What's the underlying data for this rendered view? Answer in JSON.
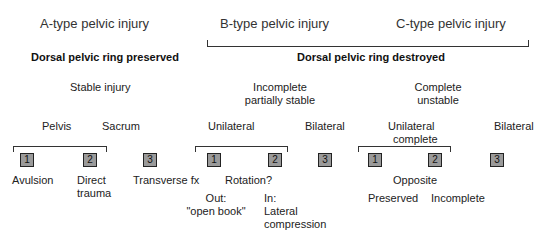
{
  "headers": {
    "a_type": "A-type pelvic injury",
    "b_type": "B-type pelvic injury",
    "c_type": "C-type pelvic injury"
  },
  "dorsal": {
    "preserved": "Dorsal pelvic ring preserved",
    "destroyed": "Dorsal pelvic ring destroyed"
  },
  "stability": {
    "a": "Stable injury",
    "b_line1": "Incomplete",
    "b_line2": "partially stable",
    "c_line1": "Complete",
    "c_line2": "unstable"
  },
  "subgroups": {
    "a_pelvis": "Pelvis",
    "a_sacrum": "Sacrum",
    "b_unilateral": "Unilateral",
    "b_bilateral": "Bilateral",
    "c_unilateral_line1": "Unilateral",
    "c_unilateral_line2": "complete",
    "c_bilateral": "Bilateral"
  },
  "boxes": [
    "1",
    "2",
    "3",
    "1",
    "2",
    "3",
    "1",
    "2",
    "3"
  ],
  "labels": {
    "a1": "Avulsion",
    "a2_line1": "Direct",
    "a2_line2": "trauma",
    "a3": "Transverse fx",
    "b_rotation": "Rotation?",
    "b_out_line1": "Out:",
    "b_out_line2": "\"open book\"",
    "b_in_line1": "In:",
    "b_in_line2": "Lateral",
    "b_in_line3": "compression",
    "c_opposite": "Opposite",
    "c_preserved": "Preserved",
    "c_incomplete": "Incomplete"
  }
}
